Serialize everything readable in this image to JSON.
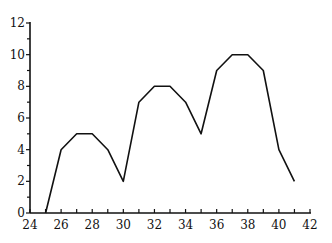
{
  "chart_data": {
    "type": "line",
    "title": "",
    "xlabel": "",
    "ylabel": "",
    "x": [
      25,
      26,
      27,
      28,
      29,
      30,
      31,
      32,
      33,
      34,
      35,
      36,
      37,
      38,
      39,
      40,
      41
    ],
    "series": [
      {
        "name": "series",
        "values": [
          0,
          4,
          5,
          5,
          4,
          2,
          7,
          8,
          8,
          7,
          5,
          9,
          10,
          10,
          9,
          4,
          2
        ]
      }
    ],
    "xlim": [
      24,
      42
    ],
    "ylim": [
      0,
      12
    ],
    "x_ticks": [
      24,
      26,
      28,
      30,
      32,
      34,
      36,
      38,
      40,
      42
    ],
    "x_minor_ticks": [
      25,
      27,
      29,
      31,
      33,
      35,
      37,
      39,
      41
    ],
    "y_ticks": [
      0,
      2,
      4,
      6,
      8,
      10,
      12
    ],
    "y_minor_ticks": [
      1,
      3,
      5,
      7,
      9,
      11
    ],
    "grid": false,
    "legend": "none",
    "line_color": "#111111"
  }
}
